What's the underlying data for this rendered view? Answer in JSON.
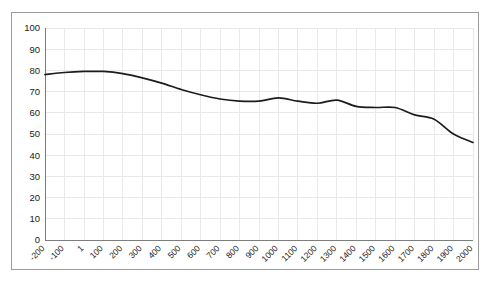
{
  "chart_data": {
    "type": "line",
    "title": "",
    "subtitle": "",
    "xlabel": "",
    "ylabel": "",
    "xlim": [
      -200,
      2000
    ],
    "ylim": [
      0,
      100
    ],
    "grid": true,
    "legend": false,
    "legend_position": "none",
    "line_color": "#1c1c1c",
    "grid_color": "#e9e9e9",
    "axis_color": "#7d7d7d",
    "frame_color": "#9a9a9a",
    "y_ticks": [
      0,
      10,
      20,
      30,
      40,
      50,
      60,
      70,
      80,
      90,
      100
    ],
    "y_tick_labels": [
      "0",
      "10",
      "20",
      "30",
      "40",
      "50",
      "60",
      "70",
      "80",
      "90",
      "100"
    ],
    "x_ticks": [
      -200,
      -100,
      1,
      100,
      200,
      300,
      400,
      500,
      600,
      700,
      800,
      900,
      1000,
      1100,
      1200,
      1300,
      1400,
      1500,
      1600,
      1700,
      1800,
      1900,
      2000
    ],
    "x_tick_labels": [
      "-200",
      "-100",
      "1",
      "100",
      "200",
      "300",
      "400",
      "500",
      "600",
      "700",
      "800",
      "900",
      "1000",
      "1100",
      "1200",
      "1300",
      "1400",
      "1500",
      "1600",
      "1700",
      "1800",
      "1900",
      "2000"
    ],
    "x_tick_rotation": 45,
    "series": [
      {
        "name": "series-1",
        "x": [
          -200,
          -100,
          1,
          100,
          200,
          300,
          400,
          500,
          600,
          700,
          800,
          900,
          1000,
          1100,
          1200,
          1300,
          1400,
          1500,
          1600,
          1700,
          1800,
          1900,
          2000
        ],
        "values": [
          78,
          79,
          79.5,
          79.5,
          78.5,
          76.5,
          74,
          71,
          68.5,
          66.5,
          65.5,
          65.5,
          67,
          65.5,
          64.5,
          66,
          63,
          62.5,
          62.5,
          59,
          57,
          50,
          46
        ]
      }
    ]
  }
}
